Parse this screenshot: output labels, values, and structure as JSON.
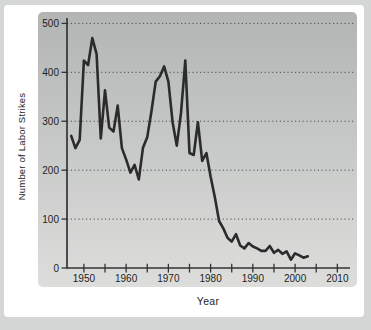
{
  "figure": {
    "xlabel": "Year",
    "ylabel": "Number of Labor Strikes"
  },
  "colors": {
    "page_bg": "#d5d7d6",
    "figure_bg": "#ffffff",
    "panel_top": "#b2b5b4",
    "panel_bottom": "#dddedc",
    "axis": "#333333",
    "grid": "#4d4d4d",
    "line": "#2b2b2b",
    "text": "#1e1e1e"
  },
  "chart_data": {
    "type": "line",
    "title": "",
    "xlabel": "Year",
    "ylabel": "Number of Labor Strikes",
    "xlim": [
      1946,
      2013
    ],
    "ylim": [
      0,
      500
    ],
    "x_major_ticks": [
      1950,
      1960,
      1970,
      1980,
      1990,
      2000,
      2010
    ],
    "x_minor_tick_interval": 5,
    "y_ticks": [
      0,
      100,
      200,
      300,
      400,
      500
    ],
    "grid": "horizontal-dotted",
    "legend": "none",
    "x": [
      1947,
      1948,
      1949,
      1950,
      1951,
      1952,
      1953,
      1954,
      1955,
      1956,
      1957,
      1958,
      1959,
      1960,
      1961,
      1962,
      1963,
      1964,
      1965,
      1966,
      1967,
      1968,
      1969,
      1970,
      1971,
      1972,
      1973,
      1974,
      1975,
      1976,
      1977,
      1978,
      1979,
      1980,
      1981,
      1982,
      1983,
      1984,
      1985,
      1986,
      1987,
      1988,
      1989,
      1990,
      1991,
      1992,
      1993,
      1994,
      1995,
      1996,
      1997,
      1998,
      1999,
      2000,
      2001,
      2002,
      2003
    ],
    "values": [
      270,
      245,
      262,
      424,
      415,
      470,
      437,
      265,
      363,
      287,
      279,
      332,
      245,
      222,
      195,
      211,
      181,
      246,
      268,
      321,
      381,
      392,
      412,
      381,
      298,
      250,
      317,
      424,
      235,
      231,
      298,
      219,
      235,
      187,
      145,
      96,
      81,
      62,
      54,
      69,
      46,
      40,
      51,
      44,
      40,
      35,
      35,
      45,
      31,
      37,
      29,
      34,
      17,
      30,
      26,
      21,
      24
    ]
  }
}
